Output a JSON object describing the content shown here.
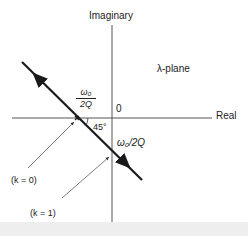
{
  "diagram": {
    "axes": {
      "vertical_label": "Imaginary",
      "horizontal_label": "Real",
      "origin_label": "0"
    },
    "plane_label": "λ-plane",
    "pole_fraction": {
      "numerator": "ω₀",
      "denominator": "2Q"
    },
    "angle_label": "45°",
    "intercept_label": "ω₀/2Q",
    "annotations": [
      {
        "label": "(k = 0)",
        "points_to": "pole on real axis"
      },
      {
        "label": "(k = 1)",
        "points_to": "intercept on imaginary axis"
      }
    ],
    "colors": {
      "line": "#1a1a1a",
      "axis": "#555555",
      "background": "#ffffff"
    }
  }
}
